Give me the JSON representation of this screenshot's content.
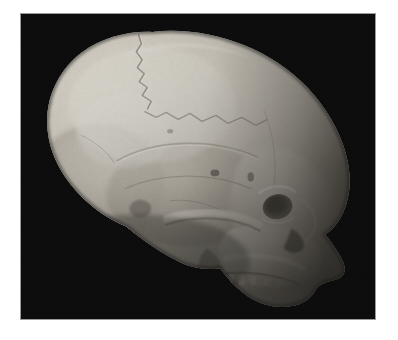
{
  "page": {
    "background_color": "#ffffff",
    "width": 398,
    "height": 340
  },
  "photo": {
    "name": "skull-lateral-view-photograph",
    "subject": "human skull",
    "view": "lateral (right profile), facing right",
    "background_color": "#000000",
    "border_color": "#9a9a9a",
    "frame": {
      "x": 20,
      "y": 13,
      "width": 356,
      "height": 307
    },
    "palette": {
      "bone_highlight": "#f2efe7",
      "bone_light": "#ddd8cd",
      "bone_mid": "#bdb7ab",
      "bone_shadow": "#8d877c",
      "bone_dark": "#5d584f",
      "cavity_dark": "#231f1c",
      "background": "#000000"
    },
    "anatomy": [
      {
        "id": "cranial-vault",
        "label": "Cranial vault (parietal / frontal)"
      },
      {
        "id": "occipital-region",
        "label": "Occipital region"
      },
      {
        "id": "coronal-suture",
        "label": "Coronal suture"
      },
      {
        "id": "lambdoid-suture",
        "label": "Lambdoid suture"
      },
      {
        "id": "temporal-line",
        "label": "Temporal line"
      },
      {
        "id": "temporal-bone",
        "label": "Temporal bone"
      },
      {
        "id": "mastoid-process",
        "label": "Mastoid process"
      },
      {
        "id": "external-auditory-meatus",
        "label": "External auditory meatus"
      },
      {
        "id": "zygomatic-arch",
        "label": "Zygomatic arch"
      },
      {
        "id": "orbit",
        "label": "Orbit (eye socket)"
      },
      {
        "id": "nasal-aperture",
        "label": "Nasal aperture"
      },
      {
        "id": "maxilla",
        "label": "Maxilla"
      },
      {
        "id": "alveolar-margin",
        "label": "Alveolar margin / teeth"
      }
    ]
  }
}
